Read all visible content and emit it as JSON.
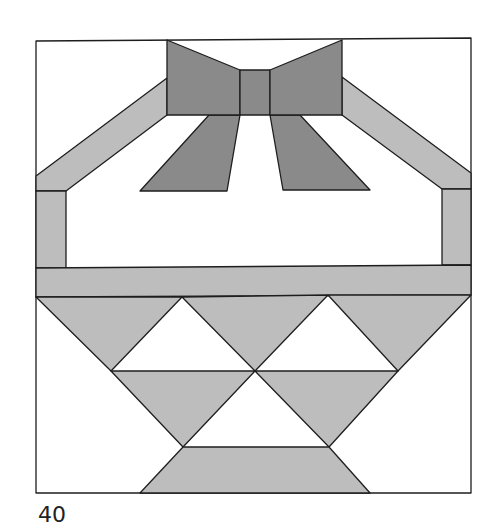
{
  "figure": {
    "number_label": "40"
  },
  "colors": {
    "background": "#ffffff",
    "dark": "#8a8a8a",
    "light": "#bdbdbd",
    "outline": "#1e1e1e"
  },
  "shapes": [
    {
      "name": "outer-square",
      "fill": "background",
      "points": "36,41 471,38 471,493 36,493"
    },
    {
      "name": "handle-left",
      "fill": "light",
      "points": "36,176 167,78 167,115 66,191 36,191"
    },
    {
      "name": "handle-right",
      "fill": "light",
      "points": "342,77 471,173 471,189 442,189 342,115"
    },
    {
      "name": "ribbon-left",
      "fill": "dark",
      "points": "209,115 240,115 227,191 140,191"
    },
    {
      "name": "ribbon-right",
      "fill": "dark",
      "points": "270,115 300,115 370,190 283,190"
    },
    {
      "name": "bow-wing-left",
      "fill": "dark",
      "points": "167,40 240,70 240,115 167,115"
    },
    {
      "name": "bow-knot",
      "fill": "dark",
      "points": "240,70 270,70 270,115 240,115"
    },
    {
      "name": "bow-wing-right",
      "fill": "dark",
      "points": "270,70 342,40 342,115 270,115"
    },
    {
      "name": "basket-post-left",
      "fill": "light",
      "points": "36,191 66,191 66,268 36,268"
    },
    {
      "name": "basket-post-right",
      "fill": "light",
      "points": "442,189 471,189 471,265 442,265"
    },
    {
      "name": "basket-rim",
      "fill": "light",
      "points": "36,268 471,265 471,295 36,297"
    },
    {
      "name": "tri-row1-a",
      "fill": "light",
      "points": "36,297 182,297 111,371"
    },
    {
      "name": "tri-row1-b",
      "fill": "light",
      "points": "182,297 328,295 255,371"
    },
    {
      "name": "tri-row1-c",
      "fill": "light",
      "points": "328,295 471,295 398,371"
    },
    {
      "name": "tri-row2-a",
      "fill": "light",
      "points": "111,371 255,371 183,447"
    },
    {
      "name": "tri-row2-b",
      "fill": "light",
      "points": "255,371 398,371 329,447"
    },
    {
      "name": "basket-foot",
      "fill": "light",
      "points": "183,447 329,447 370,493 140,493"
    }
  ]
}
